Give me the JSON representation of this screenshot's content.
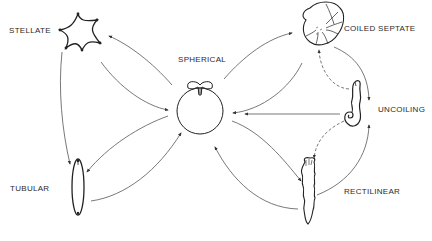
{
  "diagram": {
    "type": "morphology-transition-network",
    "colors": {
      "line": "#555555",
      "shape": "#222222",
      "text": "#2a2a2a",
      "background": "#ffffff"
    },
    "nodes": [
      {
        "id": "stellate",
        "label": "STELLATE"
      },
      {
        "id": "spherical",
        "label": "SPHERICAL"
      },
      {
        "id": "coiled_septate",
        "label": "COILED SEPTATE"
      },
      {
        "id": "uncoiling",
        "label": "UNCOILING"
      },
      {
        "id": "tubular",
        "label": "TUBULAR"
      },
      {
        "id": "rectilinear",
        "label": "RECTILINEAR"
      }
    ],
    "edges": [
      {
        "from": "spherical",
        "to": "stellate",
        "style": "solid"
      },
      {
        "from": "stellate",
        "to": "spherical",
        "style": "solid"
      },
      {
        "from": "stellate",
        "to": "tubular",
        "style": "solid"
      },
      {
        "from": "spherical",
        "to": "tubular",
        "style": "solid"
      },
      {
        "from": "tubular",
        "to": "spherical",
        "style": "solid"
      },
      {
        "from": "spherical",
        "to": "coiled_septate",
        "style": "solid"
      },
      {
        "from": "coiled_septate",
        "to": "spherical",
        "style": "solid"
      },
      {
        "from": "coiled_septate",
        "to": "uncoiling",
        "style": "solid"
      },
      {
        "from": "uncoiling",
        "to": "coiled_septate",
        "style": "dashed"
      },
      {
        "from": "uncoiling",
        "to": "spherical",
        "style": "solid"
      },
      {
        "from": "spherical",
        "to": "rectilinear",
        "style": "solid"
      },
      {
        "from": "rectilinear",
        "to": "spherical",
        "style": "solid"
      },
      {
        "from": "rectilinear",
        "to": "uncoiling",
        "style": "solid"
      },
      {
        "from": "uncoiling",
        "to": "rectilinear",
        "style": "dashed"
      }
    ]
  }
}
